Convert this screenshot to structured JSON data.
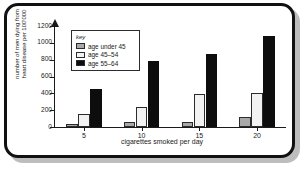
{
  "chart_data": {
    "type": "bar",
    "title": "",
    "xlabel": "cigarettes smoked per day",
    "ylabel": "number of men dying from\nheart disease per 100'000",
    "categories": [
      "5",
      "10",
      "15",
      "20"
    ],
    "series": [
      {
        "name": "age under 45",
        "color": "#a8a8a8",
        "values": [
          30,
          60,
          65,
          120
        ]
      },
      {
        "name": "age 45–54",
        "color": "#f2f2f2",
        "values": [
          155,
          240,
          395,
          410
        ]
      },
      {
        "name": "age 55–64",
        "color": "#0d0d0d",
        "values": [
          455,
          785,
          865,
          1085
        ]
      }
    ],
    "ylim": [
      0,
      1200
    ],
    "yticks": [
      0,
      200,
      400,
      600,
      800,
      1000,
      1200
    ],
    "ytick_labels": [
      "0",
      "200",
      "400",
      "600",
      "800",
      "1000",
      "1200"
    ],
    "grid": false,
    "legend_position": "top-left",
    "legend_title": "key"
  },
  "frame": {
    "border_color": "#111111",
    "shadow_color": "#bdbdbd",
    "background": "#ffffff"
  }
}
